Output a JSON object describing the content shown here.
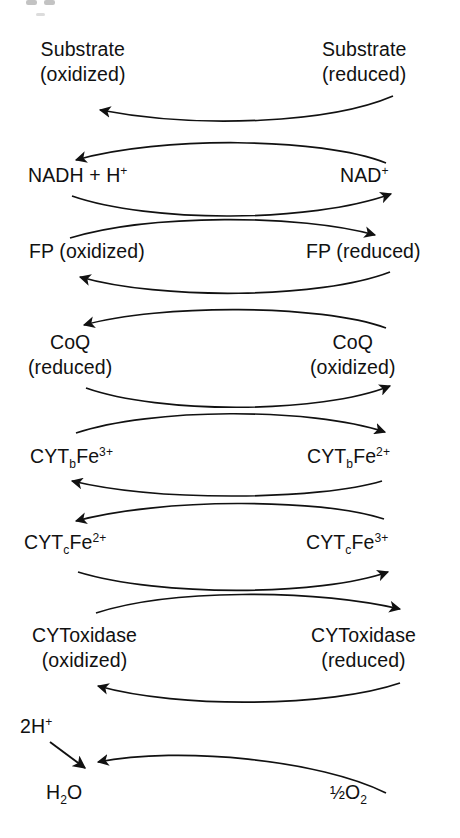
{
  "figure": {
    "type": "diagram",
    "width": 460,
    "height": 838,
    "background": "#ffffff",
    "ink_color": "#111111",
    "top_artifact_present": true
  },
  "rows": [
    {
      "id": "substrate",
      "left_label": "Substrate\n(oxidized)",
      "left_line1": "Substrate",
      "left_line2": "(oxidized)",
      "right_line1": "Substrate",
      "right_line2": "(reduced)",
      "arrow_direction": "right-to-left"
    },
    {
      "id": "nad",
      "left_line1": "NADH + H",
      "left_sup": "+",
      "right_line1": "NAD",
      "right_sup": "+",
      "arrow_directions": [
        "right-to-left",
        "left-to-right"
      ]
    },
    {
      "id": "fp",
      "left_line1": "FP (oxidized)",
      "right_line1": "FP (reduced)",
      "arrow_directions": [
        "left-to-right",
        "right-to-left"
      ]
    },
    {
      "id": "coq",
      "left_line1": "CoQ",
      "left_line2": "(reduced)",
      "right_line1": "CoQ",
      "right_line2": "(oxidized)",
      "arrow_directions": [
        "right-to-left",
        "left-to-right"
      ]
    },
    {
      "id": "cyt-b",
      "left_main": "CYT",
      "left_sub": "b",
      "left_tail": "Fe",
      "left_sup": "3+",
      "right_main": "CYT",
      "right_sub": "b",
      "right_tail": "Fe",
      "right_sup": "2+",
      "arrow_directions": [
        "left-to-right",
        "right-to-left"
      ]
    },
    {
      "id": "cyt-c",
      "left_main": "CYT",
      "left_sub": "c",
      "left_tail": "Fe",
      "left_sup": "2+",
      "right_main": "CYT",
      "right_sub": "c",
      "right_tail": "Fe",
      "right_sup": "3+",
      "arrow_directions": [
        "right-to-left",
        "left-to-right"
      ]
    },
    {
      "id": "cyt-oxidase",
      "left_line1": "CYToxidase",
      "left_line2": "(oxidized)",
      "right_line1": "CYToxidase",
      "right_line2": "(reduced)",
      "arrow_directions": [
        "left-to-right",
        "right-to-left"
      ]
    },
    {
      "id": "water",
      "proton_label_main": "2H",
      "proton_label_sup": "+",
      "left_main": "H",
      "left_sub": "2",
      "left_tail": "O",
      "right_frac": "½",
      "right_main": "O",
      "right_sub": "2",
      "arrow_directions": [
        "proton-to-water",
        "right-to-left"
      ]
    }
  ]
}
